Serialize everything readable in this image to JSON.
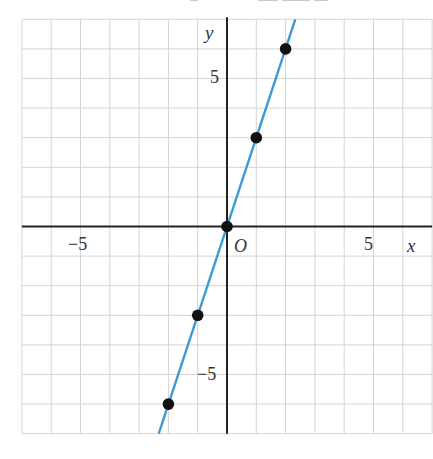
{
  "chart_data": {
    "type": "line",
    "title": "",
    "xlabel": "x",
    "ylabel": "y",
    "origin_label": "O",
    "xlim": [
      -7,
      7
    ],
    "ylim": [
      -7,
      7
    ],
    "grid": true,
    "grid_step": 1,
    "x_ticks_labeled": [
      -5,
      5
    ],
    "y_ticks_labeled": [
      -5,
      5
    ],
    "tick_labels": {
      "x_neg": "−5",
      "x_pos": "5",
      "y_pos": "5",
      "y_neg": "−5"
    },
    "series": [
      {
        "name": "y = 3x",
        "kind": "line",
        "slope": 3,
        "intercept": 0,
        "color": "#3d9ad6",
        "x": [
          -2.33,
          2.33
        ],
        "y": [
          -7,
          7
        ]
      },
      {
        "name": "points",
        "kind": "scatter",
        "color": "#111111",
        "x": [
          -2,
          -1,
          0,
          1,
          2
        ],
        "y": [
          -6,
          -3,
          0,
          3,
          6
        ]
      }
    ],
    "legend": null
  },
  "colors": {
    "grid": "#d4d4d4",
    "axis": "#222222",
    "line": "#3d9ad6",
    "point": "#111111",
    "text": "#333333"
  }
}
